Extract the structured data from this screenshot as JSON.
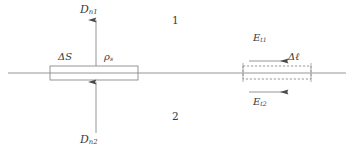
{
  "figure": {
    "background_color": "#ffffff",
    "line_color": "#7a7a7a",
    "text_color": "#3a3a3a",
    "width": 354,
    "height": 152
  },
  "labels": {
    "d_normal_1": "D",
    "d_normal_1_sub": "n1",
    "d_normal_2": "D",
    "d_normal_2_sub": "n2",
    "delta_s": "ΔS",
    "rho_s": "ρ",
    "rho_s_sub": "s",
    "region_1": "1",
    "region_2": "2",
    "e_tangential_1": "E",
    "e_tangential_1_sub": "t1",
    "e_tangential_2": "E",
    "e_tangential_2_sub": "t2",
    "delta_l": "Δℓ"
  },
  "elements": {
    "interface_line": "horizontal-interface-line",
    "gaussian_pillbox": "solid-rectangle-pillbox",
    "amperian_loop": "dashed-rectangle-contour",
    "arrow_up_top": "D-n1-arrow-upward",
    "arrow_up_bottom": "D-n2-arrow-upward",
    "arrow_right_top": "E-t1-arrow-rightward",
    "arrow_right_bottom": "E-t2-arrow-rightward"
  },
  "geometry": {
    "interface_y": 73,
    "interface_x_start": 8,
    "interface_x_end": 346,
    "pillbox": {
      "x": 50,
      "y": 66,
      "width": 88,
      "height": 14
    },
    "loop": {
      "x": 243,
      "y": 66,
      "width": 68,
      "height": 13
    }
  }
}
